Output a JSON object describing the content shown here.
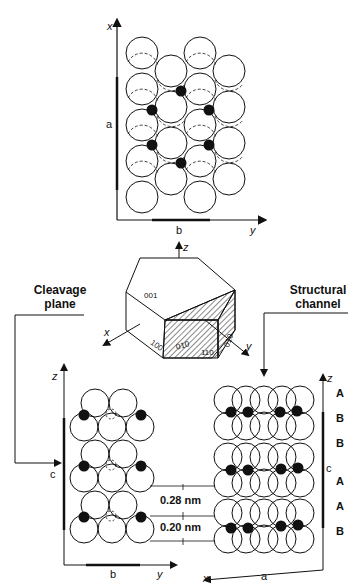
{
  "top_panel": {
    "axis_x": "x",
    "axis_y": "y",
    "dim_a": "a",
    "dim_b": "b"
  },
  "crystal": {
    "axis_z": "z",
    "axis_x": "x",
    "axis_y": "y",
    "faces": [
      "001",
      "100",
      "010",
      "110",
      "010"
    ]
  },
  "callouts": {
    "cleavage": [
      "Cleavage",
      "plane"
    ],
    "channel": [
      "Structural",
      "channel"
    ]
  },
  "left_panel": {
    "axis_z": "z",
    "axis_y": "y",
    "dim_c": "c",
    "dim_b": "b"
  },
  "distances": [
    "0.28 nm",
    "0.20 nm"
  ],
  "right_panel": {
    "axis_z": "z",
    "axis_x": "x",
    "dim_c": "c",
    "dim_a": "a",
    "stacking": [
      "A",
      "B",
      "B",
      "A",
      "A",
      "B"
    ]
  }
}
